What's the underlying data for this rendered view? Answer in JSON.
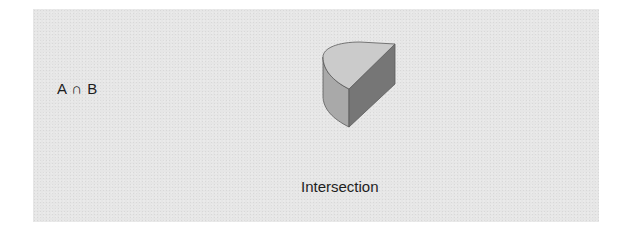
{
  "diagram": {
    "formula": "A ∩ B",
    "caption": "Intersection",
    "shape": {
      "type": "half-cylinder",
      "colors": {
        "top_face": "#cbcbcb",
        "curved_face": "#a9a9a9",
        "cut_face": "#767676",
        "outline": "#5a5a5a",
        "panel_background": "#e6e6e6"
      }
    }
  }
}
